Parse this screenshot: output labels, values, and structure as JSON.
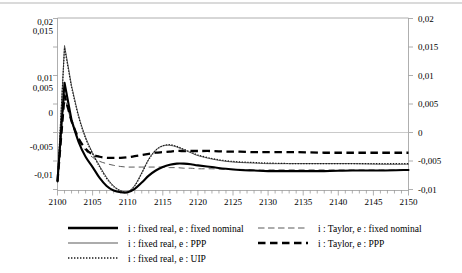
{
  "chart_data": {
    "type": "line",
    "title": "",
    "xlabel": "",
    "ylabel": "",
    "xlim": [
      2100,
      2150
    ],
    "ylim": [
      -0.01,
      0.02
    ],
    "grid": false,
    "legend_position": "bottom",
    "decimal_separator": ",",
    "x_ticks_major": [
      "2100",
      "2105",
      "2110",
      "2115",
      "2120",
      "2125",
      "2130",
      "2135",
      "2140",
      "2145",
      "2150"
    ],
    "x_tick_step_minor": 1,
    "y_ticks_left": [
      "0,02",
      "0,015",
      "0,01",
      "0,005",
      "0",
      "-0,005",
      "-0,01"
    ],
    "y_ticks_right": [
      "0,02",
      "0,015",
      "0,01",
      "0,005",
      "0",
      "-0,005",
      "-0,01"
    ],
    "x": [
      2100,
      2101,
      2102,
      2103,
      2104,
      2105,
      2106,
      2107,
      2108,
      2109,
      2110,
      2111,
      2112,
      2113,
      2114,
      2115,
      2116,
      2117,
      2118,
      2119,
      2120,
      2122,
      2124,
      2126,
      2128,
      2130,
      2134,
      2138,
      2142,
      2146,
      2150
    ],
    "series": [
      {
        "name": "i : fixed real, e : fixed nominal",
        "style": "solid-thick",
        "color": "#000000",
        "values": [
          -0.0085,
          0.0087,
          0.0022,
          -0.0016,
          -0.0042,
          -0.006,
          -0.0079,
          -0.0093,
          -0.0101,
          -0.0104,
          -0.0104,
          -0.0098,
          -0.0087,
          -0.0075,
          -0.0066,
          -0.006,
          -0.0056,
          -0.0054,
          -0.0054,
          -0.0055,
          -0.0057,
          -0.006,
          -0.0063,
          -0.0065,
          -0.0066,
          -0.0067,
          -0.0067,
          -0.0067,
          -0.0066,
          -0.0066,
          -0.0065
        ]
      },
      {
        "name": "i : fixed real, e : PPP",
        "style": "solid-thin",
        "color": "#4a4a4a",
        "values": [
          -0.0085,
          0.0152,
          0.0082,
          0.003,
          -0.0008,
          -0.0035,
          -0.0058,
          -0.0078,
          -0.0093,
          -0.0101,
          -0.0103,
          -0.0092,
          -0.007,
          -0.0046,
          -0.003,
          -0.0023,
          -0.0022,
          -0.0025,
          -0.003,
          -0.0035,
          -0.004,
          -0.0046,
          -0.005,
          -0.0052,
          -0.0053,
          -0.0054,
          -0.0054,
          -0.0054,
          -0.0054,
          -0.0055,
          -0.0055
        ]
      },
      {
        "name": "i : fixed real, e : UIP",
        "style": "dotted",
        "color": "#1a1a1a",
        "values": [
          -0.0085,
          0.0148,
          0.0079,
          0.0028,
          -0.001,
          -0.0037,
          -0.006,
          -0.008,
          -0.0094,
          -0.0102,
          -0.0104,
          -0.0093,
          -0.0071,
          -0.0047,
          -0.0031,
          -0.0023,
          -0.0021,
          -0.0024,
          -0.0029,
          -0.0034,
          -0.0039,
          -0.0045,
          -0.0049,
          -0.0051,
          -0.0052,
          -0.0053,
          -0.0054,
          -0.0054,
          -0.0054,
          -0.0054,
          -0.0054
        ]
      },
      {
        "name": "i : Taylor, e : fixed nominal",
        "style": "dash-thin",
        "color": "#4a4a4a",
        "values": [
          -0.0085,
          0.0062,
          0.0018,
          -0.0012,
          -0.0031,
          -0.0043,
          -0.005,
          -0.0054,
          -0.0057,
          -0.0059,
          -0.006,
          -0.006,
          -0.006,
          -0.006,
          -0.006,
          -0.006,
          -0.0061,
          -0.0061,
          -0.0062,
          -0.0062,
          -0.0063,
          -0.0063,
          -0.0064,
          -0.0064,
          -0.0065,
          -0.0065,
          -0.0065,
          -0.0065,
          -0.0065,
          -0.0065,
          -0.0065
        ]
      },
      {
        "name": "i : Taylor, e : PPP",
        "style": "dash-thick",
        "color": "#000000",
        "values": [
          -0.0085,
          0.0065,
          0.002,
          -0.001,
          -0.0028,
          -0.0038,
          -0.0042,
          -0.0044,
          -0.0044,
          -0.0044,
          -0.0043,
          -0.0041,
          -0.0039,
          -0.0037,
          -0.0035,
          -0.0034,
          -0.0033,
          -0.0032,
          -0.0032,
          -0.0032,
          -0.0032,
          -0.0032,
          -0.0033,
          -0.0033,
          -0.0034,
          -0.0034,
          -0.0034,
          -0.0035,
          -0.0035,
          -0.0035,
          -0.0035
        ]
      }
    ],
    "legend": {
      "left_column": [
        {
          "label": "i : fixed real, e : fixed nominal",
          "style": "solid-thick"
        },
        {
          "label": "i : fixed real, e : PPP",
          "style": "solid-thin"
        },
        {
          "label": "i : fixed real, e : UIP",
          "style": "dotted"
        }
      ],
      "right_column": [
        {
          "label": "i : Taylor, e : fixed nominal",
          "style": "dash-thin"
        },
        {
          "label": "i : Taylor, e : PPP",
          "style": "dash-thick"
        }
      ]
    }
  },
  "axis_left": {
    "t0": "0,02",
    "t1": "0,015",
    "t2": "0,01",
    "t3": "0,005",
    "t4": "0",
    "t5": "-0,005",
    "t6": "-0,01"
  },
  "axis_right": {
    "t0": "0,02",
    "t1": "0,015",
    "t2": "0,01",
    "t3": "0,005",
    "t4": "0",
    "t5": "-0,005",
    "t6": "-0,01"
  },
  "axis_x": {
    "t0": "2100",
    "t1": "2105",
    "t2": "2110",
    "t3": "2115",
    "t4": "2120",
    "t5": "2125",
    "t6": "2130",
    "t7": "2135",
    "t8": "2140",
    "t9": "2145",
    "t10": "2150"
  },
  "legend_labels": {
    "l0": "i : fixed real, e : fixed nominal",
    "l1": "i : fixed real, e : PPP",
    "l2": "i : fixed real, e : UIP",
    "r0": "i : Taylor, e : fixed nominal",
    "r1": "i : Taylor, e : PPP"
  }
}
